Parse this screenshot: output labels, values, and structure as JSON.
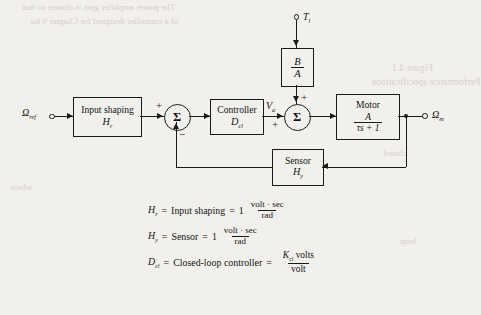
{
  "diagram": {
    "inputs": {
      "reference": "Ω",
      "reference_sub": "ref",
      "load_torque": "T",
      "load_torque_sub": "l"
    },
    "output": {
      "label": "Ω",
      "label_sub": "m"
    },
    "signals": {
      "va": "V",
      "va_sub": "a"
    },
    "blocks": [
      {
        "id": "input-shaping",
        "line1": "Input shaping",
        "line2": "H",
        "line2_sub": "r"
      },
      {
        "id": "controller",
        "line1": "Controller",
        "line2": "D",
        "line2_sub": "cl"
      },
      {
        "id": "disturbance-gain",
        "numerator": "B",
        "denominator": "A"
      },
      {
        "id": "motor",
        "line1": "Motor",
        "numerator": "A",
        "denominator": "τs + 1"
      },
      {
        "id": "sensor",
        "line1": "Sensor",
        "line2": "H",
        "line2_sub": "y"
      }
    ],
    "summers": {
      "error": {
        "glyph": "Σ",
        "sign_in": "+",
        "sign_feedback": "−"
      },
      "disturbance": {
        "glyph": "Σ",
        "sign_top": "+",
        "sign_left": "+"
      }
    },
    "colors": {
      "ink": "#1a1a1a",
      "paper": "#f2f0ec"
    }
  },
  "equations": [
    {
      "id": "input-shaping-eq",
      "lhs": "H",
      "lhs_sub": "r",
      "rhs_text": "Input shaping",
      "value": "1",
      "num": "volt · sec",
      "den": "rad"
    },
    {
      "id": "sensor-eq",
      "lhs": "H",
      "lhs_sub": "y",
      "rhs_text": "Sensor",
      "value": "1",
      "num": "volt · sec",
      "den": "rad"
    },
    {
      "id": "controller-eq",
      "lhs": "D",
      "lhs_sub": "cl",
      "rhs_text": "Closed-loop controller",
      "value": "",
      "num": "K",
      "num_sub": "cl",
      "num_tail": " volts",
      "den": "volt"
    }
  ],
  "equals": "=",
  "bleed_text": {
    "t1": "The  power  amplifier  gain  is  chosen  so  that",
    "t2": "of  a  controller  designed  for  Chapter  9  for",
    "t3": "Figure 4.1",
    "t4": "Performance  specifications",
    "t5": "where",
    "t6": "closed",
    "t7": "loop"
  }
}
